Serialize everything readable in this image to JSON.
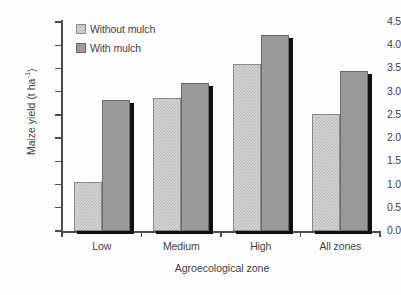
{
  "chart_data": {
    "type": "bar",
    "title": "",
    "xlabel": "Agroecological zone",
    "ylabel": "Maize yield (t ha-1)",
    "ylabel_main": "Maize yield (t ha",
    "ylabel_exp": "-1",
    "ylabel_tail": ")",
    "categories": [
      "Low",
      "Medium",
      "High",
      "All zones"
    ],
    "series": [
      {
        "name": "Without mulch",
        "values": [
          1.05,
          2.87,
          3.6,
          2.51
        ],
        "fill": "#d8d8d8",
        "pattern": "checkered"
      },
      {
        "name": "With mulch",
        "values": [
          2.82,
          3.18,
          4.22,
          3.45
        ],
        "fill": "#9a9a9a",
        "pattern": "solid"
      }
    ],
    "ylim": [
      0.0,
      4.5
    ],
    "ytick_step": 0.5,
    "ytick_labels": [
      "0.0",
      "0.5",
      "1.0",
      "1.5",
      "2.0",
      "2.5",
      "3.0",
      "3.5",
      "4.0",
      "4.5"
    ],
    "ytick_values": [
      0.0,
      0.5,
      1.0,
      1.5,
      2.0,
      2.5,
      3.0,
      3.5,
      4.0,
      4.5
    ],
    "grid": false,
    "legend_position": "top-left-inside",
    "bar_shadow_color": "#101010",
    "axis_color": "#4d4d4d",
    "text_color": "#3f3f3f",
    "background": "#ffffff"
  },
  "legend": {
    "items": [
      {
        "label": "Without mulch"
      },
      {
        "label": "With mulch"
      }
    ]
  }
}
